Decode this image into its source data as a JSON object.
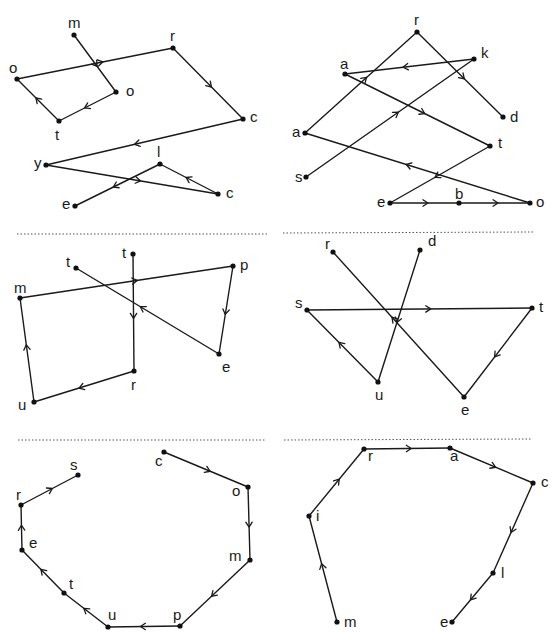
{
  "separators": [
    {
      "x1": 17,
      "y1": 234,
      "x2": 267,
      "y2": 234
    },
    {
      "x1": 283,
      "y1": 233,
      "x2": 533,
      "y2": 232
    },
    {
      "x1": 18,
      "y1": 440,
      "x2": 266,
      "y2": 440
    },
    {
      "x1": 284,
      "y1": 440,
      "x2": 531,
      "y2": 439
    }
  ],
  "puzzles": [
    {
      "id": "motorcycle",
      "word": "motorcycle",
      "points": [
        {
          "letter": "m",
          "x": 74,
          "y": 35,
          "lx": 68,
          "ly": 28
        },
        {
          "letter": "o",
          "x": 116,
          "y": 92,
          "lx": 126,
          "ly": 96
        },
        {
          "letter": "t",
          "x": 59,
          "y": 121,
          "lx": 55,
          "ly": 140
        },
        {
          "letter": "o",
          "x": 17,
          "y": 79,
          "lx": 9,
          "ly": 73
        },
        {
          "letter": "r",
          "x": 173,
          "y": 48,
          "lx": 170,
          "ly": 41
        },
        {
          "letter": "c",
          "x": 243,
          "y": 119,
          "lx": 250,
          "ly": 122
        },
        {
          "letter": "y",
          "x": 46,
          "y": 165,
          "lx": 34,
          "ly": 168
        },
        {
          "letter": "c",
          "x": 218,
          "y": 194,
          "lx": 226,
          "ly": 198
        },
        {
          "letter": "l",
          "x": 160,
          "y": 164,
          "lx": 157,
          "ly": 157
        },
        {
          "letter": "e",
          "x": 75,
          "y": 206,
          "lx": 62,
          "ly": 209
        }
      ]
    },
    {
      "id": "skateboard",
      "word": "skateboard",
      "points": [
        {
          "letter": "s",
          "x": 306,
          "y": 177,
          "lx": 295,
          "ly": 182
        },
        {
          "letter": "k",
          "x": 474,
          "y": 59,
          "lx": 481,
          "ly": 58
        },
        {
          "letter": "a",
          "x": 345,
          "y": 74,
          "lx": 340,
          "ly": 69
        },
        {
          "letter": "t",
          "x": 490,
          "y": 146,
          "lx": 498,
          "ly": 148
        },
        {
          "letter": "e",
          "x": 390,
          "y": 203,
          "lx": 377,
          "ly": 207
        },
        {
          "letter": "b",
          "x": 459,
          "y": 203,
          "lx": 455,
          "ly": 199
        },
        {
          "letter": "o",
          "x": 530,
          "y": 203,
          "lx": 536,
          "ly": 207
        },
        {
          "letter": "a",
          "x": 305,
          "y": 133,
          "lx": 292,
          "ly": 137
        },
        {
          "letter": "r",
          "x": 417,
          "y": 32,
          "lx": 414,
          "ly": 25
        },
        {
          "letter": "d",
          "x": 503,
          "y": 117,
          "lx": 510,
          "ly": 122
        }
      ]
    },
    {
      "id": "trumpet",
      "word": "trumpet",
      "points": [
        {
          "letter": "t",
          "x": 133,
          "y": 254,
          "lx": 122,
          "ly": 258
        },
        {
          "letter": "r",
          "x": 134,
          "y": 371,
          "lx": 131,
          "ly": 390
        },
        {
          "letter": "u",
          "x": 34,
          "y": 402,
          "lx": 18,
          "ly": 410
        },
        {
          "letter": "m",
          "x": 20,
          "y": 298,
          "lx": 14,
          "ly": 293
        },
        {
          "letter": "p",
          "x": 233,
          "y": 266,
          "lx": 240,
          "ly": 270
        },
        {
          "letter": "e",
          "x": 219,
          "y": 354,
          "lx": 222,
          "ly": 372
        },
        {
          "letter": "t",
          "x": 76,
          "y": 268,
          "lx": 66,
          "ly": 267
        }
      ]
    },
    {
      "id": "duster",
      "word": "duster",
      "points": [
        {
          "letter": "d",
          "x": 420,
          "y": 250,
          "lx": 428,
          "ly": 246
        },
        {
          "letter": "u",
          "x": 378,
          "y": 382,
          "lx": 375,
          "ly": 400
        },
        {
          "letter": "s",
          "x": 307,
          "y": 310,
          "lx": 295,
          "ly": 308
        },
        {
          "letter": "t",
          "x": 532,
          "y": 308,
          "lx": 539,
          "ly": 312
        },
        {
          "letter": "e",
          "x": 464,
          "y": 397,
          "lx": 461,
          "ly": 415
        },
        {
          "letter": "r",
          "x": 333,
          "y": 252,
          "lx": 325,
          "ly": 249
        }
      ]
    },
    {
      "id": "computers",
      "word": "computers",
      "points": [
        {
          "letter": "c",
          "x": 164,
          "y": 452,
          "lx": 155,
          "ly": 466
        },
        {
          "letter": "o",
          "x": 248,
          "y": 487,
          "lx": 232,
          "ly": 496
        },
        {
          "letter": "m",
          "x": 250,
          "y": 560,
          "lx": 229,
          "ly": 561
        },
        {
          "letter": "p",
          "x": 180,
          "y": 626,
          "lx": 173,
          "ly": 620
        },
        {
          "letter": "u",
          "x": 108,
          "y": 627,
          "lx": 108,
          "ly": 620
        },
        {
          "letter": "t",
          "x": 64,
          "y": 593,
          "lx": 69,
          "ly": 589
        },
        {
          "letter": "e",
          "x": 22,
          "y": 550,
          "lx": 29,
          "ly": 548
        },
        {
          "letter": "r",
          "x": 21,
          "y": 505,
          "lx": 16,
          "ly": 500
        },
        {
          "letter": "s",
          "x": 78,
          "y": 475,
          "lx": 70,
          "ly": 470
        }
      ]
    },
    {
      "id": "miracle",
      "word": "miracle",
      "points": [
        {
          "letter": "m",
          "x": 337,
          "y": 622,
          "lx": 344,
          "ly": 627
        },
        {
          "letter": "i",
          "x": 309,
          "y": 516,
          "lx": 316,
          "ly": 521
        },
        {
          "letter": "r",
          "x": 364,
          "y": 449,
          "lx": 368,
          "ly": 461
        },
        {
          "letter": "a",
          "x": 450,
          "y": 448,
          "lx": 450,
          "ly": 461
        },
        {
          "letter": "c",
          "x": 533,
          "y": 483,
          "lx": 541,
          "ly": 487
        },
        {
          "letter": "l",
          "x": 493,
          "y": 573,
          "lx": 501,
          "ly": 578
        },
        {
          "letter": "e",
          "x": 452,
          "y": 622,
          "lx": 440,
          "ly": 627
        }
      ]
    }
  ],
  "style": {
    "line_color": "#1a1a1a",
    "point_color": "#111111",
    "separator_color": "#555555",
    "background": "#ffffff"
  }
}
